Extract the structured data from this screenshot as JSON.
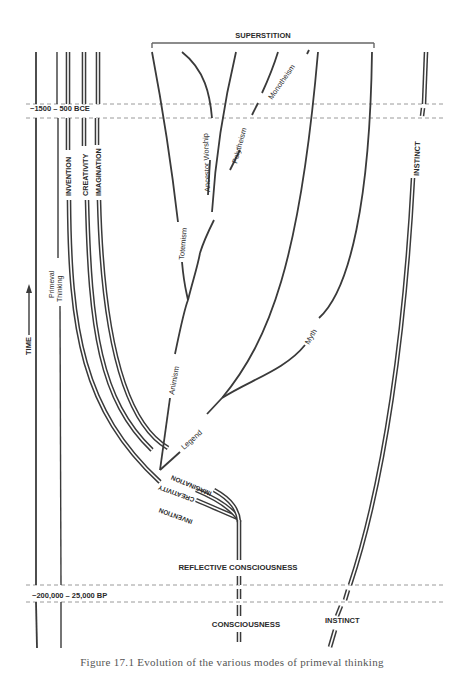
{
  "diagram": {
    "title": "Evolution of the various modes of primeval thinking",
    "bracket_label": "SUPERSTITION",
    "time_bands": [
      {
        "label": "~1500 – 500 BCE"
      },
      {
        "label": "~200,000 – 25,000 BP"
      }
    ],
    "axis": {
      "label": "TIME",
      "arrow": "up-arrow"
    },
    "left_columns": [
      {
        "label": "Primeval Thinking",
        "line1": "Primeval",
        "line2": "Thinking"
      },
      {
        "label": "INVENTION"
      },
      {
        "label": "CREATIVITY"
      },
      {
        "label": "IMAGINATION"
      }
    ],
    "curved_labels": {
      "imagination": "IMAGINATION",
      "creativity": "CREATIVITY",
      "invention": "INVENTION"
    },
    "branches": [
      {
        "label": "Animism"
      },
      {
        "label": "Totemism"
      },
      {
        "label": "Ancestor Worship"
      },
      {
        "label": "Polytheism"
      },
      {
        "label": "Monotheism"
      },
      {
        "label": "Legend"
      },
      {
        "label": "Myth"
      }
    ],
    "trunk": {
      "reflective": "REFLECTIVE CONSCIOUSNESS",
      "consciousness": "CONSCIOUSNESS"
    },
    "instinct": {
      "upper_label": "INSTINCT",
      "lower_label": "INSTINCT"
    },
    "caption": "Figure 17.1 Evolution of the various modes of primeval thinking"
  }
}
